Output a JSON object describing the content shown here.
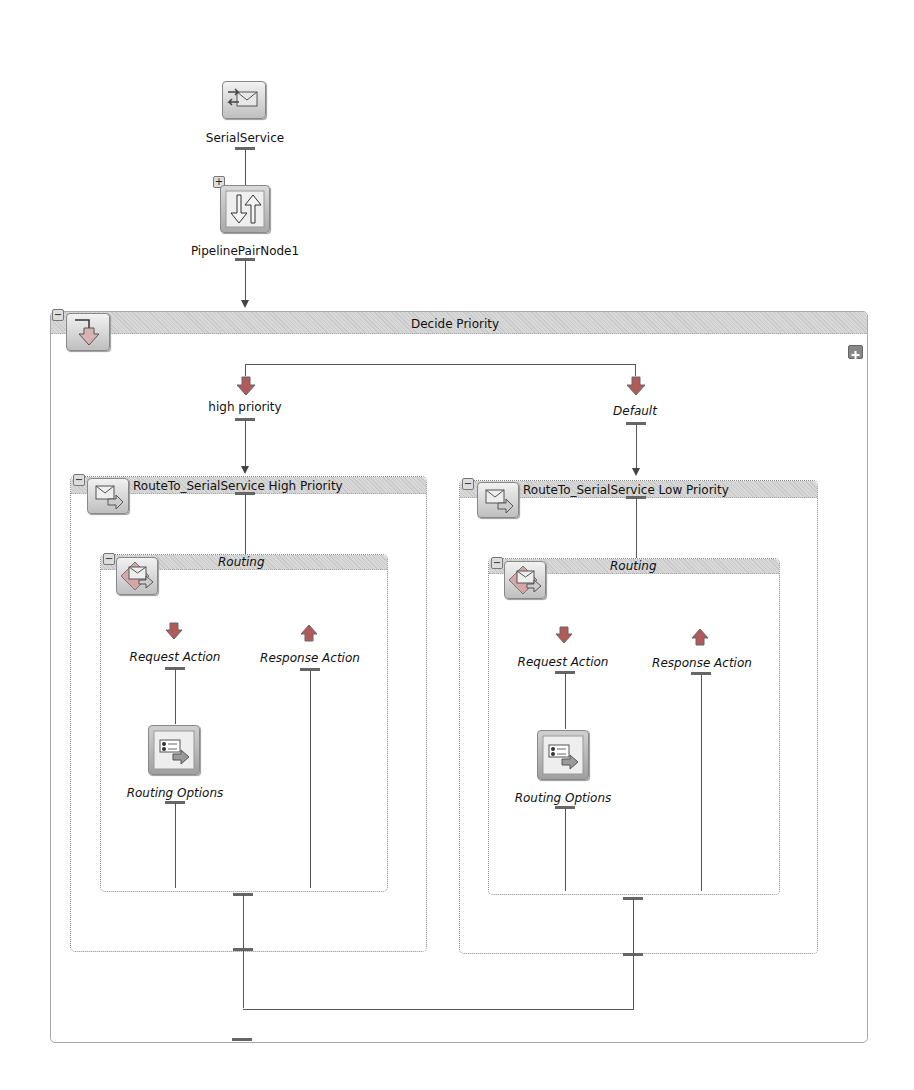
{
  "diagram": {
    "proxy_service": {
      "label": "SerialService",
      "icon": "proxy-service-icon"
    },
    "pipeline_pair": {
      "label": "PipelinePairNode1",
      "icon": "pipeline-pair-icon",
      "toggle": "+"
    },
    "branch_node": {
      "title": "Decide Priority",
      "icon": "conditional-branch-icon",
      "toggle": "−",
      "add_branch_icon": "add-branch-icon",
      "branches": [
        {
          "label": "high priority",
          "italic": false,
          "route_node": {
            "title": "RouteTo_SerialService High Priority",
            "toggle": "−",
            "icon": "route-node-icon",
            "routing": {
              "title": "Routing",
              "toggle": "−",
              "icon": "routing-action-icon",
              "request_action": "Request Action",
              "response_action": "Response Action",
              "routing_options": "Routing Options"
            }
          }
        },
        {
          "label": "Default",
          "italic": true,
          "route_node": {
            "title": "RouteTo_SerialService Low Priority",
            "toggle": "−",
            "icon": "route-node-icon",
            "routing": {
              "title": "Routing",
              "toggle": "−",
              "icon": "routing-action-icon",
              "request_action": "Request Action",
              "response_action": "Response Action",
              "routing_options": "Routing Options"
            }
          }
        }
      ]
    }
  }
}
